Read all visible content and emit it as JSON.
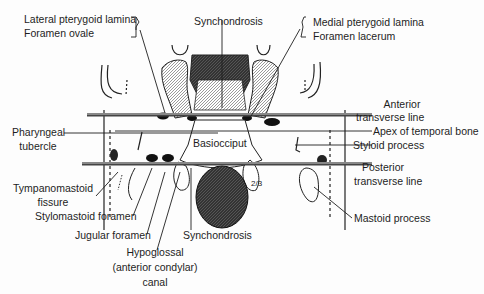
{
  "figure": {
    "labels": {
      "lateral_pterygoid": "Lateral pterygoid lamina",
      "foramen_ovale": "Foramen ovale",
      "synchondrosis_top": "Synchondrosis",
      "medial_pterygoid": "Medial pterygoid lamina",
      "foramen_lacerum": "Foramen lacerum",
      "anterior_line_1": "Anterior",
      "anterior_line_2": "transverse line",
      "apex_temporal": "Apex of temporal bone",
      "styloid": "Styloid process",
      "pharyngeal_1": "Pharyngeal",
      "pharyngeal_2": "tubercle",
      "basiocciput": "Basiocciput",
      "posterior_line_1": "Posterior",
      "posterior_line_2": "transverse line",
      "tympanomastoid_1": "Tympanomastoid",
      "tympanomastoid_2": "fissure",
      "stylomastoid": "Stylomastoid foramen",
      "jugular": "Jugular foramen",
      "synchondrosis_bottom": "Synchondrosis",
      "mastoid": "Mastoid process",
      "hypoglossal_1": "Hypoglossal",
      "hypoglossal_2": "(anterior condylar)",
      "hypoglossal_3": "canal",
      "fraction_mark": "2/3"
    }
  }
}
